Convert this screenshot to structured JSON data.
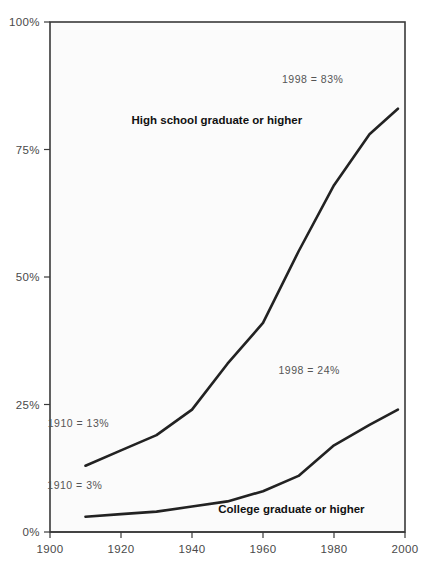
{
  "chart_data": {
    "type": "line",
    "title": "",
    "xlabel": "",
    "ylabel": "",
    "xlim": [
      1900,
      2000
    ],
    "ylim": [
      0,
      100
    ],
    "grid": false,
    "legend_position": "inline-annotation",
    "xticks": [
      "1900",
      "1920",
      "1940",
      "1960",
      "1980",
      "2000"
    ],
    "xtick_values": [
      1900,
      1920,
      1940,
      1960,
      1980,
      2000
    ],
    "yticks": [
      "0%",
      "25%",
      "50%",
      "75%",
      "100%"
    ],
    "ytick_values": [
      0,
      25,
      50,
      75,
      100
    ],
    "series": [
      {
        "name": "High school graduate or higher",
        "x": [
          1910,
          1920,
          1930,
          1940,
          1950,
          1960,
          1970,
          1980,
          1990,
          1998
        ],
        "values": [
          13,
          16,
          19,
          24,
          33,
          41,
          55,
          68,
          78,
          83
        ]
      },
      {
        "name": "College graduate or higher",
        "x": [
          1910,
          1920,
          1930,
          1940,
          1950,
          1960,
          1970,
          1980,
          1990,
          1998
        ],
        "values": [
          3,
          3.5,
          4,
          5,
          6,
          8,
          11,
          17,
          21,
          24
        ]
      }
    ],
    "annotations": [
      {
        "id": "hs-end",
        "text": "1998 = 83%",
        "x": 1974,
        "y": 88
      },
      {
        "id": "hs-start",
        "text": "1910 = 13%",
        "x": 1908,
        "y": 20.5
      },
      {
        "id": "college-end",
        "text": "1998 = 24%",
        "x": 1973,
        "y": 31
      },
      {
        "id": "college-start",
        "text": "1910 = 3%",
        "x": 1907,
        "y": 8.5
      }
    ],
    "series_labels": [
      {
        "id": "hs-label",
        "text": "High school graduate or higher",
        "x": 1947,
        "y": 80
      },
      {
        "id": "college-label",
        "text": "College graduate or higher",
        "x": 1968,
        "y": 3.8
      }
    ],
    "colors": {
      "line": "#222222",
      "frame": "#3a3a3a",
      "tick_text": "#4a4a4a",
      "annotation_text": "#555555",
      "series_label_text": "#111111",
      "plot_background": "#fbfbfb",
      "page_background": "#ffffff"
    }
  }
}
